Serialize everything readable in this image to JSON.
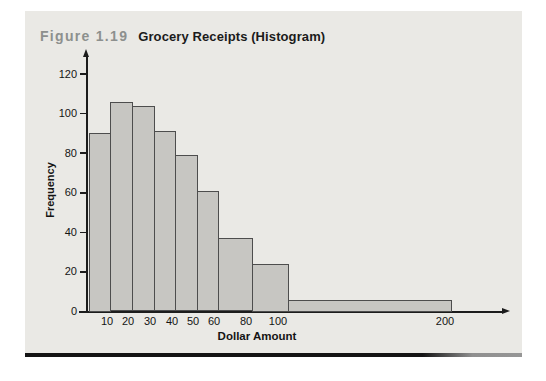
{
  "figure": {
    "label": "Figure 1.19",
    "title": "Grocery Receipts (Histogram)"
  },
  "chart_data": {
    "type": "bar",
    "subtype": "histogram",
    "title": "Grocery Receipts (Histogram)",
    "xlabel": "Dollar Amount",
    "ylabel": "Frequency",
    "ylim": [
      0,
      120
    ],
    "y_ticks": [
      0,
      20,
      40,
      60,
      80,
      100,
      120
    ],
    "x_tick_labels": [
      "10",
      "20",
      "30",
      "40",
      "50",
      "60",
      "80",
      "100",
      "200"
    ],
    "grid": false,
    "legend": false,
    "bins": [
      {
        "range": "0-10",
        "frequency": 90
      },
      {
        "range": "10-20",
        "frequency": 106
      },
      {
        "range": "20-30",
        "frequency": 104
      },
      {
        "range": "30-40",
        "frequency": 91
      },
      {
        "range": "40-50",
        "frequency": 79
      },
      {
        "range": "50-60",
        "frequency": 61
      },
      {
        "range": "60-80",
        "frequency": 37
      },
      {
        "range": "80-100",
        "frequency": 24
      },
      {
        "range": "100-200",
        "frequency": 6
      }
    ],
    "colors": {
      "bar_fill": "#c7c6c2",
      "bar_border": "#4d4d4d",
      "panel_background": "#eae9e5",
      "axis": "#1c1c1c",
      "figure_label_gray": "#8d908e"
    }
  }
}
